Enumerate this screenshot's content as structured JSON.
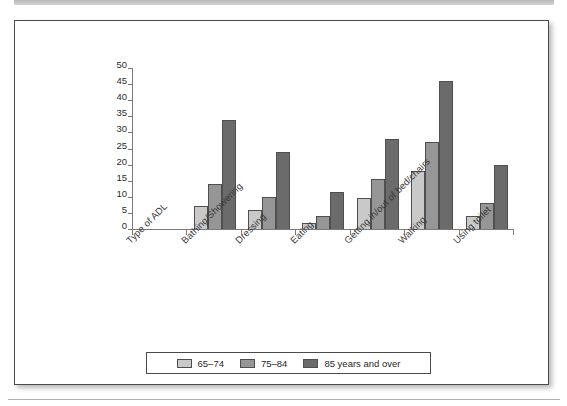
{
  "page": {
    "background_color": "#ffffff",
    "frame_border_color": "#4a4a4a"
  },
  "chart_data": {
    "type": "bar",
    "title": "",
    "subtitle": "",
    "xlabel": "Type of ADL",
    "ylabel": "",
    "ylim": [
      0,
      50
    ],
    "ytick_step": 5,
    "yticks": [
      "50",
      "45",
      "40",
      "35",
      "30",
      "25",
      "20",
      "15",
      "10",
      "5",
      "0"
    ],
    "grid": false,
    "legend_position": "bottom",
    "axis_slot_labels": [
      "Type of ADL",
      "Bathing/Showering",
      "Dressing",
      "Eating",
      "Getting in/out of bed/chairs",
      "Walking",
      "Using toilet"
    ],
    "categories": [
      "Bathing/Showering",
      "Dressing",
      "Eating",
      "Getting in/out of bed/chairs",
      "Walking",
      "Using toilet"
    ],
    "series": [
      {
        "name": "65–74",
        "color": "#c9c9c9",
        "values": [
          7,
          6,
          2,
          9.5,
          18,
          4
        ]
      },
      {
        "name": "75–84",
        "color": "#969696",
        "values": [
          14,
          10,
          4,
          15.5,
          27,
          8
        ]
      },
      {
        "name": "85 years and over",
        "color": "#6b6b6b",
        "values": [
          34,
          24,
          11.5,
          28,
          46,
          20
        ]
      }
    ]
  },
  "legend": {
    "items": [
      {
        "label": "65–74",
        "color": "#c9c9c9"
      },
      {
        "label": "75–84",
        "color": "#969696"
      },
      {
        "label": "85 years and over",
        "color": "#6b6b6b"
      }
    ]
  }
}
